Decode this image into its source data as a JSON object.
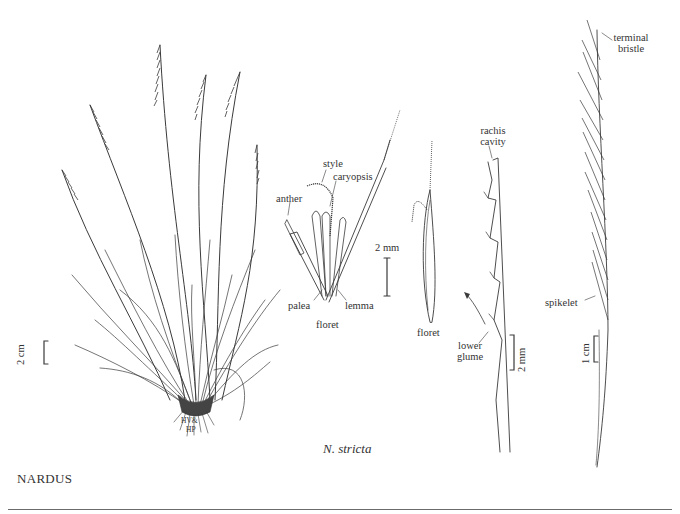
{
  "figure": {
    "genus_heading": "NARDUS",
    "species_caption": "N. stricta",
    "artist_monogram": "HV & HP",
    "colors": {
      "ink": "#3a3a3a",
      "background": "#ffffff",
      "rule": "#6b6b6b"
    }
  },
  "panels": {
    "habit": {
      "scale_bar": "2 cm"
    },
    "floret_dissected": {
      "labels": {
        "style": "style",
        "caryopsis": "caryopsis",
        "anther": "anther",
        "palea": "palea",
        "lemma": "lemma",
        "floret": "floret"
      },
      "scale_bar": "2 mm"
    },
    "floret_whole": {
      "label": "floret"
    },
    "rachis": {
      "labels": {
        "rachis_cavity_line1": "rachis",
        "rachis_cavity_line2": "cavity",
        "lower_glume_line1": "lower",
        "lower_glume_line2": "glume"
      },
      "scale_bar": "2 mm"
    },
    "inflorescence": {
      "labels": {
        "terminal_bristle_line1": "terminal",
        "terminal_bristle_line2": "bristle",
        "spikelet": "spikelet"
      },
      "scale_bar": "1 cm"
    }
  }
}
